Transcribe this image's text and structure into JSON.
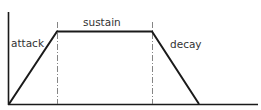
{
  "diagram": {
    "type": "envelope",
    "labels": {
      "attack": "attack",
      "sustain": "sustain",
      "decay": "decay"
    },
    "colors": {
      "line": "#1a1a1a",
      "guide": "#666666",
      "text": "#333333"
    }
  }
}
